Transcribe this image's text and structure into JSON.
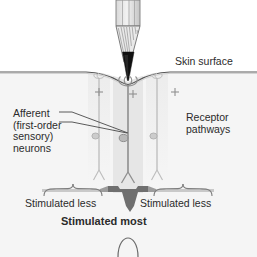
{
  "figure": {
    "type": "anatomical-diagram",
    "background_color": "#ffffff"
  },
  "labels": {
    "skin_surface": "Skin surface",
    "afferent": "Afferent\n(first-order\nsensory)\nneurons",
    "receptor_pathways": "Receptor\npathways",
    "stimulated_less_left": "Stimulated less",
    "stimulated_less_right": "Stimulated less",
    "stimulated_most": "Stimulated most"
  },
  "annotations": {
    "plus_signs": [
      "+",
      "+",
      "+"
    ]
  },
  "colors": {
    "text": "#2b2b2b",
    "skin_line": "#5a5a5a",
    "dermis_fill": "#f4f4f4",
    "column_light": "#efefef",
    "column_center": "#e2e2e2",
    "neuron_gray": "#b4b4b4",
    "neuron_center": "#8f8f8f",
    "pencil_tip": "#111111",
    "pencil_wood": "#9a9a9a",
    "brace": "#7d7d7d",
    "band_dark": "#6e6e6e",
    "band_light": "#c8c8c8"
  }
}
